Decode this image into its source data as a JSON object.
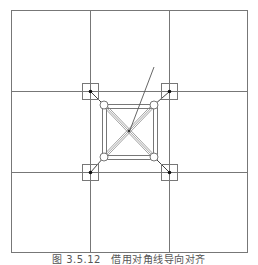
{
  "figure": {
    "caption": "图 3.5.12　借用对角线导向对齐",
    "colors": {
      "background": "#ffffff",
      "line": "#777777",
      "brace": "#888888",
      "dot": "#111111",
      "caption": "#555555"
    },
    "outer_frame": {
      "x1": 11,
      "y1": 10,
      "x2": 247,
      "y2": 252
    },
    "grid": {
      "vertical_lines_x": [
        90,
        169
      ],
      "horizontal_lines_y": [
        91,
        172
      ]
    },
    "anchor_points": [
      {
        "name": "top-left",
        "x": 90,
        "y": 91
      },
      {
        "name": "top-right",
        "x": 169,
        "y": 91
      },
      {
        "name": "bottom-left",
        "x": 90,
        "y": 172
      },
      {
        "name": "bottom-right",
        "x": 169,
        "y": 172
      }
    ],
    "anchor_box_size": 16,
    "circles": [
      {
        "name": "top-left",
        "x": 104,
        "y": 105
      },
      {
        "name": "top-right",
        "x": 154,
        "y": 105
      },
      {
        "name": "bottom-left",
        "x": 104,
        "y": 157
      },
      {
        "name": "bottom-right",
        "x": 154,
        "y": 157
      }
    ],
    "circle_radius": 4,
    "center_square": {
      "outer": {
        "x1": 102,
        "y1": 104,
        "x2": 157,
        "y2": 159
      },
      "inner": {
        "x1": 106,
        "y1": 108,
        "x2": 153,
        "y2": 155
      }
    },
    "center_point": {
      "x": 129,
      "y": 131
    },
    "leader_line": {
      "x1": 154,
      "y1": 67,
      "x2": 130,
      "y2": 130
    }
  }
}
